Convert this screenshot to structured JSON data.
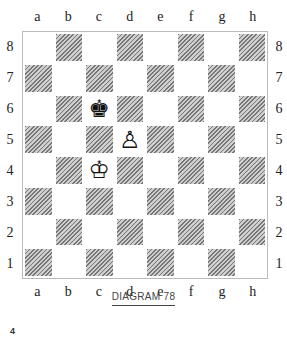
{
  "files": [
    "a",
    "b",
    "c",
    "d",
    "e",
    "f",
    "g",
    "h"
  ],
  "ranks": [
    "8",
    "7",
    "6",
    "5",
    "4",
    "3",
    "2",
    "1"
  ],
  "pieces": [
    {
      "square": "c6",
      "piece": "black-king",
      "glyph": "♚"
    },
    {
      "square": "d5",
      "piece": "white-pawn",
      "glyph": "♙"
    },
    {
      "square": "c4",
      "piece": "white-king",
      "glyph": "♔"
    }
  ],
  "caption": "DIAGRAM 78",
  "page_number": "4"
}
